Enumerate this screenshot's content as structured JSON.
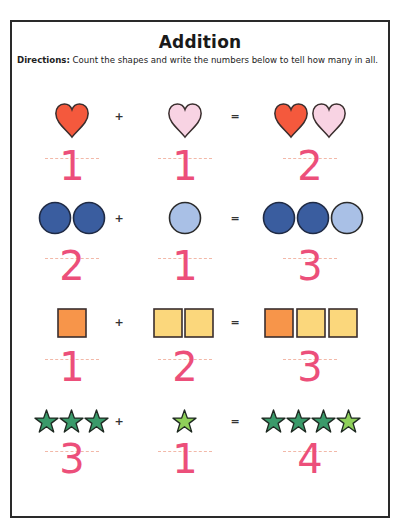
{
  "worksheet": {
    "title": "Addition",
    "directions_label": "Directions:",
    "directions_text": " Count the shapes and write the numbers below to tell how many in all.",
    "operators": {
      "plus": "+",
      "equals": "="
    },
    "colors": {
      "heart_red": "#f4593d",
      "heart_pink": "#f8d3e3",
      "circle_dark": "#3a5d9f",
      "circle_light": "#a9c0e6",
      "square_orange": "#f7954a",
      "square_yellow": "#fbd77c",
      "star_dark": "#3a9a6a",
      "star_light": "#8fd05a",
      "number_pink": "#ec4f7a",
      "outline": "#3a2e2e"
    },
    "problems": [
      {
        "shape": "heart",
        "left_count": 1,
        "right_count": 1,
        "sum": 2,
        "left_answer": "1",
        "right_answer": "1",
        "sum_answer": "2"
      },
      {
        "shape": "circle",
        "left_count": 2,
        "right_count": 1,
        "sum": 3,
        "left_answer": "2",
        "right_answer": "1",
        "sum_answer": "3"
      },
      {
        "shape": "square",
        "left_count": 1,
        "right_count": 2,
        "sum": 3,
        "left_answer": "1",
        "right_answer": "2",
        "sum_answer": "3"
      },
      {
        "shape": "star",
        "left_count": 3,
        "right_count": 1,
        "sum": 4,
        "left_answer": "3",
        "right_answer": "1",
        "sum_answer": "4"
      }
    ]
  }
}
